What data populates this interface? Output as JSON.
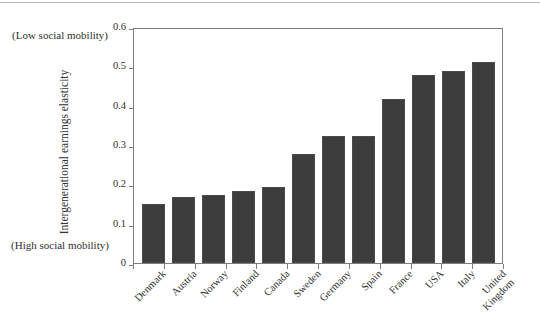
{
  "annotations": {
    "top_left": "(Low social\nmobility)",
    "bottom_left": "(High social\nmobility)"
  },
  "chart_data": {
    "type": "bar",
    "title": "",
    "subtitle": "",
    "xlabel": "",
    "ylabel": "Intergenerational earnings elasticity",
    "ylim": [
      0,
      0.6
    ],
    "yticks": [
      "0",
      "0.1",
      "0.2",
      "0.3",
      "0.4",
      "0.5",
      "0.6"
    ],
    "ytick_values": [
      0,
      0.1,
      0.2,
      0.3,
      0.4,
      0.5,
      0.6
    ],
    "grid": false,
    "legend": "none",
    "bar_color": "#3d3d3d",
    "frame_color": "#7d7d7d",
    "categories": [
      "Denmark",
      "Austria",
      "Norway",
      "Finland",
      "Canada",
      "Sweden",
      "Germany",
      "Spain",
      "France",
      "USA",
      "Italy",
      "United\nKingdom"
    ],
    "values": [
      0.15,
      0.167,
      0.172,
      0.183,
      0.194,
      0.278,
      0.323,
      0.323,
      0.417,
      0.477,
      0.487,
      0.51
    ]
  }
}
